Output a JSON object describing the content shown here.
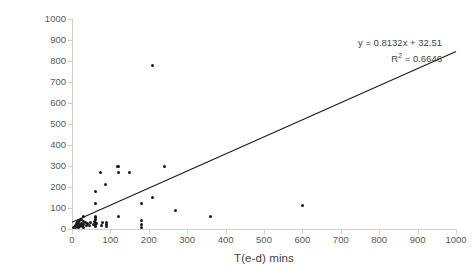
{
  "chart_data": {
    "type": "scatter",
    "title": "",
    "xlabel": "T(e-d) mins",
    "ylabel": "T(t-e) mins",
    "xlim": [
      0,
      1000
    ],
    "ylim": [
      0,
      1000
    ],
    "x_ticks": [
      "0",
      "100",
      "200",
      "300",
      "400",
      "500",
      "600",
      "700",
      "800",
      "900",
      "1000"
    ],
    "y_ticks": [
      "0",
      "100",
      "200",
      "300",
      "400",
      "500",
      "600",
      "700",
      "800",
      "900",
      "1000"
    ],
    "x_tick_values": [
      0,
      100,
      200,
      300,
      400,
      500,
      600,
      700,
      800,
      900,
      1000
    ],
    "y_tick_values": [
      0,
      100,
      200,
      300,
      400,
      500,
      600,
      700,
      800,
      900,
      1000
    ],
    "grid": false,
    "legend": "none",
    "marker_color": "#1a1a1a",
    "trendline_color": "#1a1a1a",
    "annotations": {
      "equation": "y = 0.8132x + 32.51",
      "r_squared_label": "R",
      "r_squared_sup": "2",
      "r_squared_value": " = 0.6646"
    },
    "trendline": {
      "slope": 0.8132,
      "intercept": 32.51,
      "x_start": 0,
      "x_end": 1000,
      "y_start": 32.51,
      "y_end": 845.71
    },
    "points": [
      [
        5,
        5
      ],
      [
        8,
        10
      ],
      [
        10,
        15
      ],
      [
        10,
        5
      ],
      [
        12,
        25
      ],
      [
        14,
        12
      ],
      [
        15,
        35
      ],
      [
        15,
        20
      ],
      [
        16,
        8
      ],
      [
        18,
        30
      ],
      [
        20,
        40
      ],
      [
        20,
        20
      ],
      [
        20,
        10
      ],
      [
        22,
        15
      ],
      [
        24,
        28
      ],
      [
        25,
        45
      ],
      [
        25,
        18
      ],
      [
        28,
        12
      ],
      [
        30,
        60
      ],
      [
        30,
        35
      ],
      [
        30,
        22
      ],
      [
        30,
        8
      ],
      [
        35,
        30
      ],
      [
        38,
        18
      ],
      [
        40,
        25
      ],
      [
        45,
        15
      ],
      [
        48,
        30
      ],
      [
        55,
        20
      ],
      [
        58,
        35
      ],
      [
        60,
        180
      ],
      [
        60,
        120
      ],
      [
        60,
        60
      ],
      [
        60,
        45
      ],
      [
        60,
        30
      ],
      [
        60,
        22
      ],
      [
        60,
        12
      ],
      [
        62,
        55
      ],
      [
        65,
        25
      ],
      [
        75,
        270
      ],
      [
        78,
        15
      ],
      [
        80,
        30
      ],
      [
        88,
        210
      ],
      [
        90,
        30
      ],
      [
        90,
        20
      ],
      [
        90,
        10
      ],
      [
        118,
        300
      ],
      [
        120,
        300
      ],
      [
        120,
        270
      ],
      [
        120,
        60
      ],
      [
        150,
        270
      ],
      [
        180,
        120
      ],
      [
        180,
        40
      ],
      [
        180,
        22
      ],
      [
        180,
        8
      ],
      [
        210,
        780
      ],
      [
        210,
        150
      ],
      [
        240,
        298
      ],
      [
        270,
        88
      ],
      [
        360,
        58
      ],
      [
        600,
        112
      ]
    ]
  }
}
